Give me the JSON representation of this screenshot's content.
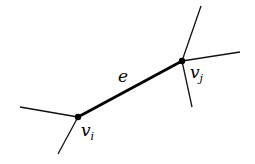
{
  "diagram": {
    "edge_label": "e",
    "vertex_i": {
      "label": "v",
      "subscript": "i"
    },
    "vertex_j": {
      "label": "v",
      "subscript": "j"
    }
  }
}
